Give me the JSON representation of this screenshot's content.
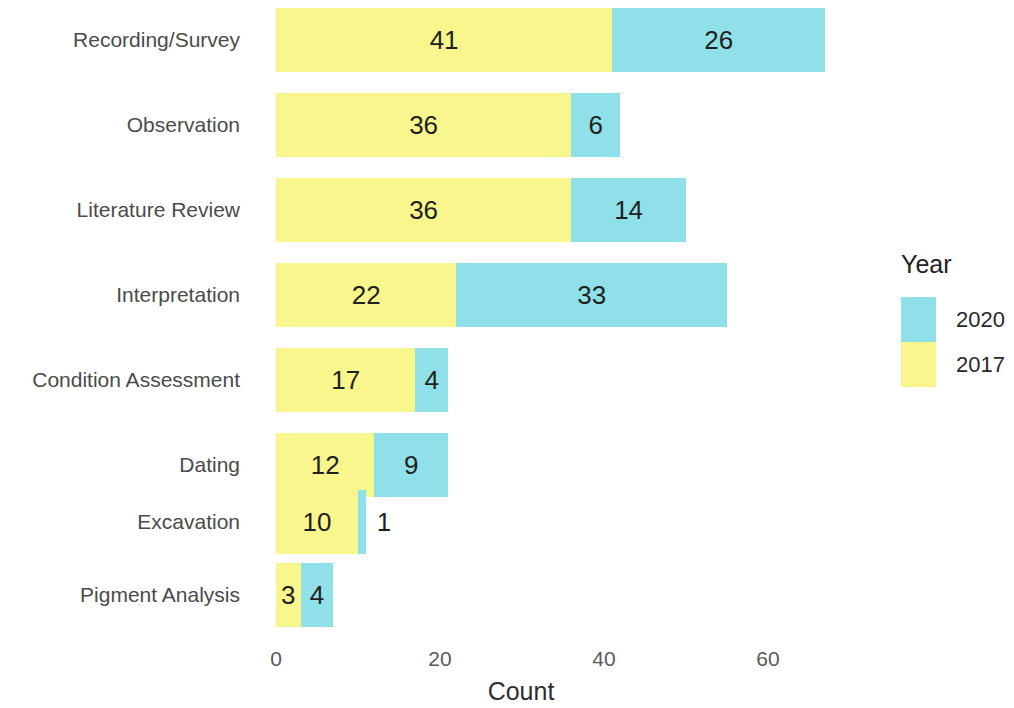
{
  "chart_data": {
    "type": "bar",
    "orientation": "horizontal",
    "stacked": true,
    "title": "",
    "xlabel": "Count",
    "ylabel": "",
    "xlim": [
      0,
      68
    ],
    "xticks": [
      0,
      20,
      40,
      60
    ],
    "xtick_labels": [
      "0",
      "20",
      "40",
      "60"
    ],
    "grid": false,
    "legend": {
      "title": "Year",
      "position": "right",
      "entries": [
        {
          "label": "2020",
          "color": "#8FE0E8"
        },
        {
          "label": "2017",
          "color": "#F8F68C"
        }
      ]
    },
    "categories": [
      "Recording/Survey",
      "Observation",
      "Literature Review",
      "Interpretation",
      "Condition Assessment",
      "Dating",
      "Excavation",
      "Pigment Analysis"
    ],
    "series": [
      {
        "name": "2017",
        "color": "#F8F68C",
        "values": [
          41,
          36,
          36,
          22,
          17,
          12,
          10,
          3
        ]
      },
      {
        "name": "2020",
        "color": "#8FE0E8",
        "values": [
          26,
          6,
          14,
          33,
          4,
          9,
          1,
          4
        ]
      }
    ],
    "totals": [
      67,
      42,
      50,
      55,
      21,
      21,
      11,
      7
    ],
    "value_labels": {
      "2017": [
        "41",
        "36",
        "36",
        "22",
        "17",
        "12",
        "10",
        "3"
      ],
      "2020": [
        "26",
        "6",
        "14",
        "33",
        "4",
        "9",
        "1",
        "4"
      ]
    }
  },
  "plot": {
    "origin_x_px": 276,
    "px_per_unit": 8.2,
    "bar_height_px": 64,
    "row_pitch_px": 85,
    "first_row_top_px": 8,
    "rows": [
      {
        "top": 8,
        "label_top": 38
      },
      {
        "top": 93,
        "label_top": 123
      },
      {
        "top": 178,
        "label_top": 208
      },
      {
        "top": 263,
        "label_top": 293
      },
      {
        "top": 348,
        "label_top": 378
      },
      {
        "top": 433,
        "label_top": 463
      },
      {
        "top": 490,
        "label_top": 510
      },
      {
        "top": 563,
        "label_top": 593
      }
    ]
  },
  "colors": {
    "year_2017": "#F8F68C",
    "year_2020": "#8FE0E8",
    "category_label": "#4b4b4b",
    "tick_label": "#5a5a5a",
    "value_label": "#1f1f1f",
    "background": "#ffffff"
  }
}
